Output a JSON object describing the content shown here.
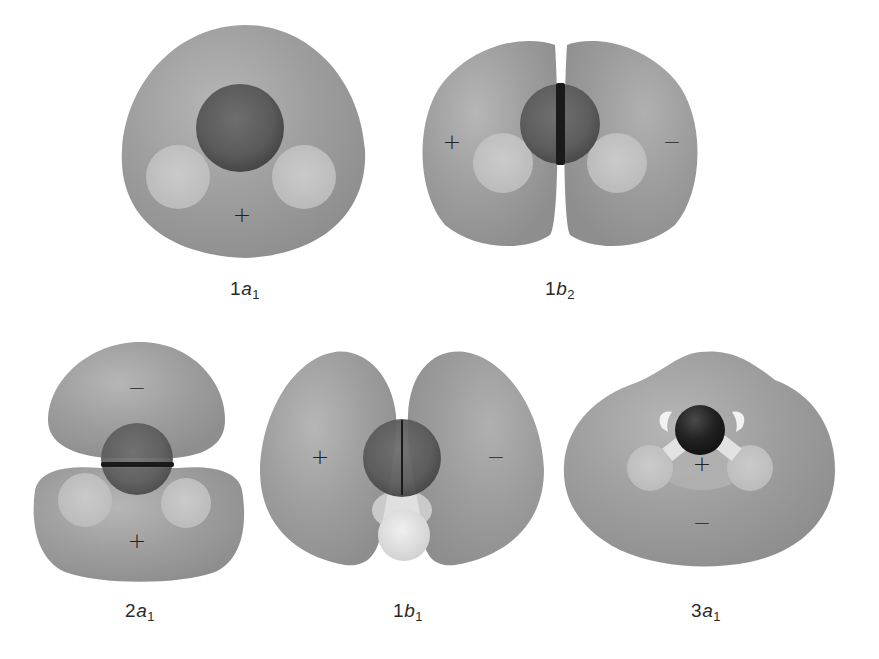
{
  "figure": {
    "colors": {
      "lobe": "#9a9a9a",
      "lobe_highlight": "#b4b4b4",
      "lobe_shadow": "#8a8a8a",
      "oxygen_atom": "#5c5c5c",
      "oxygen_dark": "#2a2a2a",
      "hydrogen_atom": "#c8c8c8",
      "hydrogen_bright": "#e6e6e6",
      "nodal_plane": "#1a1a1a",
      "text": "#2a2a2a"
    },
    "orbitals": [
      {
        "id": "1a1",
        "number": "1",
        "symmetry": "a",
        "subscript": "1",
        "signs": [
          "+"
        ],
        "row": 1
      },
      {
        "id": "1b2",
        "number": "1",
        "symmetry": "b",
        "subscript": "2",
        "signs": [
          "+",
          "−"
        ],
        "row": 1
      },
      {
        "id": "2a1",
        "number": "2",
        "symmetry": "a",
        "subscript": "1",
        "signs": [
          "−",
          "+"
        ],
        "row": 2
      },
      {
        "id": "1b1",
        "number": "1",
        "symmetry": "b",
        "subscript": "1",
        "signs": [
          "+",
          "−"
        ],
        "row": 2
      },
      {
        "id": "3a1",
        "number": "3",
        "symmetry": "a",
        "subscript": "1",
        "signs": [
          "+",
          "−"
        ],
        "row": 2
      }
    ]
  }
}
